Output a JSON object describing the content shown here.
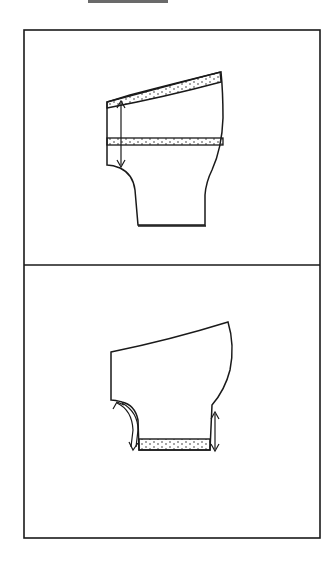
{
  "figure": {
    "type": "sewing pattern diagram",
    "panels": [
      {
        "id": "top",
        "description": "Shorts/pants leg pattern piece with waistband strip along slanted top edge and a horizontal band strip across middle; vertical double-headed arrow on left measures from waist to crotch",
        "elements": [
          "pattern-piece",
          "waistband-strip",
          "middle-band-strip",
          "measure-arrow-vertical"
        ]
      },
      {
        "id": "bottom",
        "description": "Pattern piece with hem cuff strip at bottom; curved arrow on left crotch curve and vertical double arrow on right side at hem",
        "elements": [
          "pattern-piece",
          "hem-strip",
          "curved-arrow-left",
          "measure-arrow-right"
        ]
      }
    ],
    "colors": {
      "line": "#1a1a1a",
      "background": "#ffffff",
      "strip_dot": "#333333"
    }
  }
}
